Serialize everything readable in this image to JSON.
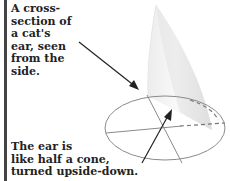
{
  "diagram": {
    "top_caption": "A cross-\nsection of\na cat's\near, seen\nfrom the\nside.",
    "bottom_caption": "The ear is\nlike half a cone,\nturned upside-down.",
    "colors": {
      "text": "#222222",
      "bar": "#444444",
      "ellipse": "#888888",
      "arrow": "#222222",
      "cone_light": "#f6f6f6",
      "cone_shade": "#dcdcdc"
    }
  }
}
